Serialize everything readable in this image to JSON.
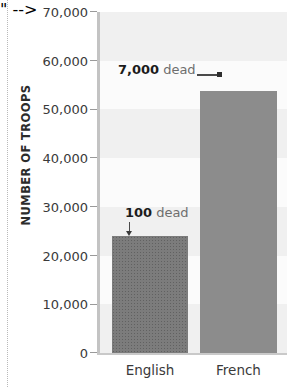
{
  "chart_data": {
    "type": "bar",
    "title": "",
    "subtitle": "",
    "xlabel": "",
    "ylabel": "NUMBER OF TROOPS",
    "categories": [
      "English",
      "French"
    ],
    "values": [
      24000,
      53800
    ],
    "series": [
      {
        "name": "Number of troops",
        "values": [
          24000,
          53800
        ]
      }
    ],
    "ylim": [
      0,
      70000
    ],
    "ytick_values": [
      0,
      10000,
      20000,
      30000,
      40000,
      50000,
      60000,
      70000
    ],
    "ytick_labels": [
      "0",
      "10,000",
      "20,000",
      "30,000",
      "40,000",
      "50,000",
      "60,000",
      "70,000"
    ],
    "grid": false,
    "background_bands": true,
    "legend": null,
    "legend_position": "none",
    "annotations": [
      {
        "id": "english-dead",
        "value_text": "100",
        "suffix_text": "dead",
        "target_category": "English",
        "target_value": 24000,
        "leader": "down-arrow"
      },
      {
        "id": "french-dead",
        "value_text": "7,000",
        "suffix_text": "dead",
        "target_category": "French",
        "target_value": 53800,
        "leader": "right-arrow"
      }
    ],
    "colors": {
      "bar_english": "#7c7c7c",
      "bar_french": "#8c8c8c",
      "plot_background": "#fbfbfb",
      "band": "#f0f0f0",
      "axis": "#c3c3c3",
      "tick": "#9a9a9a",
      "label_text": "#3a3a3a",
      "annotation_value": "#1c1c1c",
      "annotation_text": "#6e6e6e"
    }
  },
  "axis": {
    "y_title": "NUMBER OF TROOPS"
  },
  "bars": {
    "english": {
      "label": "English"
    },
    "french": {
      "label": "French"
    }
  },
  "annotations": {
    "english": {
      "value": "100",
      "word": "dead"
    },
    "french": {
      "value": "7,000",
      "word": "dead"
    }
  }
}
